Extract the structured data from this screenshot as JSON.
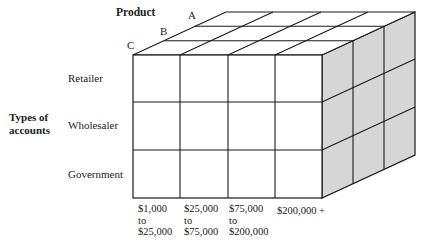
{
  "diagram": {
    "title_axis_depth": "Product",
    "depth_labels": [
      "A",
      "B",
      "C"
    ],
    "title_axis_vertical_line1": "Types of",
    "title_axis_vertical_line2": "accounts",
    "row_labels": [
      "Retailer",
      "Wholesaler",
      "Government"
    ],
    "column_labels": [
      {
        "line1": "$1,000",
        "line2": "to",
        "line3": "$25,000"
      },
      {
        "line1": "$25,000",
        "line2": "to",
        "line3": "$75,000"
      },
      {
        "line1": "$75,000",
        "line2": "to",
        "line3": "$200,000"
      },
      {
        "line1": "$200,000 +",
        "line2": "",
        "line3": ""
      }
    ],
    "colors": {
      "line": "#1a1a1a",
      "front_face": "#ffffff",
      "top_face": "#ffffff",
      "side_face": "#d6d6d6"
    },
    "grid": {
      "columns": 4,
      "rows": 3,
      "depth": 3
    }
  }
}
